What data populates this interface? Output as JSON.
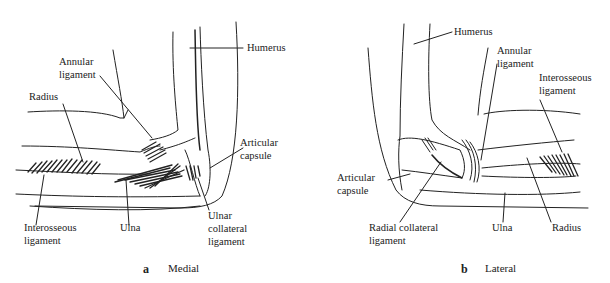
{
  "panels": [
    {
      "id": "a",
      "letter": "a",
      "view": "Medial",
      "labels": {
        "humerus": "Humerus",
        "annular_1": "Annular",
        "annular_2": "ligament",
        "radius": "Radius",
        "articular_1": "Articular",
        "articular_2": "capsule",
        "interosseous_1": "Interosseous",
        "interosseous_2": "ligament",
        "ulna": "Ulna",
        "ulnar_coll_1": "Ulnar",
        "ulnar_coll_2": "collateral",
        "ulnar_coll_3": "ligament"
      }
    },
    {
      "id": "b",
      "letter": "b",
      "view": "Lateral",
      "labels": {
        "humerus": "Humerus",
        "annular_1": "Annular",
        "annular_2": "ligament",
        "interosseous_1": "Interosseous",
        "interosseous_2": "ligament",
        "articular_1": "Articular",
        "articular_2": "capsule",
        "radial_coll_1": "Radial collateral",
        "radial_coll_2": "ligament",
        "ulna": "Ulna",
        "radius": "Radius"
      }
    }
  ]
}
